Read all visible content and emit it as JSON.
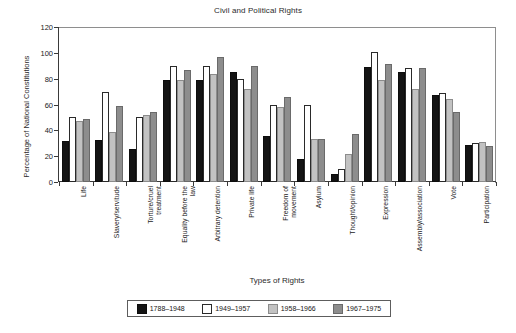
{
  "chart_data": {
    "type": "bar",
    "title": "Civil and Political Rights",
    "xlabel": "Types of Rights",
    "ylabel": "Percentage of National Constitutions",
    "ylim": [
      0,
      120
    ],
    "yticks": [
      0,
      20,
      40,
      60,
      80,
      100,
      120
    ],
    "grid": false,
    "legend_position": "bottom",
    "categories": [
      "Life",
      "Slavery/servitude",
      "Torture/cruel\ntreatment",
      "Equality before the\nlaw",
      "Arbitrary detention",
      "Private life",
      "Freedom of\nmovement",
      "Asylum",
      "Thought/opinion",
      "Expression",
      "Assembly/association",
      "Vote",
      "Participation"
    ],
    "series": [
      {
        "name": "1788–1948",
        "color": "#141414",
        "values": [
          32,
          32.5,
          25.5,
          79,
          79,
          85.5,
          36,
          18,
          6,
          89,
          85.5,
          67,
          29
        ]
      },
      {
        "name": "1949–1957",
        "color": "#ffffff",
        "values": [
          50,
          70,
          50.5,
          90,
          90,
          80,
          60,
          60,
          10,
          100.5,
          88,
          69,
          30
        ]
      },
      {
        "name": "1958–1966",
        "color": "#c2c2c2",
        "values": [
          47.5,
          38.5,
          52,
          79,
          84,
          72,
          58,
          33,
          22,
          79,
          72,
          64,
          31
        ]
      },
      {
        "name": "1967–1975",
        "color": "#8d8d8d",
        "values": [
          48.5,
          59,
          54,
          86.5,
          97,
          90,
          66,
          33,
          37,
          91.5,
          88,
          54,
          28
        ]
      }
    ]
  }
}
